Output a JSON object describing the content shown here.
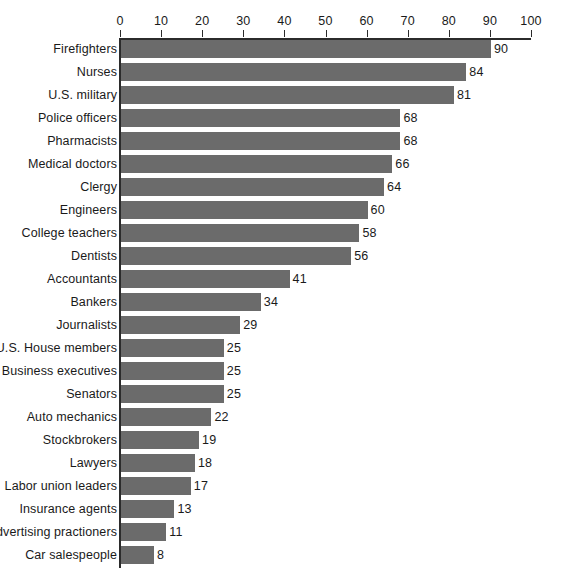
{
  "chart_data": {
    "type": "bar",
    "orientation": "horizontal",
    "title": "",
    "subtitle": "",
    "xlabel": "",
    "ylabel": "",
    "xlim": [
      0,
      100
    ],
    "grid": false,
    "legend": null,
    "tick_labels": [
      "0",
      "10",
      "20",
      "30",
      "40",
      "50",
      "60",
      "70",
      "80",
      "90",
      "100"
    ],
    "ticks": [
      0,
      10,
      20,
      30,
      40,
      50,
      60,
      70,
      80,
      90,
      100
    ],
    "categories": [
      "Firefighters",
      "Nurses",
      "U.S. military",
      "Police officers",
      "Pharmacists",
      "Medical doctors",
      "Clergy",
      "Engineers",
      "College teachers",
      "Dentists",
      "Accountants",
      "Bankers",
      "Journalists",
      "U.S. House members",
      "Business executives",
      "Senators",
      "Auto mechanics",
      "Stockbrokers",
      "Lawyers",
      "Labor union leaders",
      "Insurance agents",
      "Advertising practioners",
      "Car salespeople"
    ],
    "values": [
      90,
      84,
      81,
      68,
      68,
      66,
      64,
      60,
      58,
      56,
      41,
      34,
      29,
      25,
      25,
      25,
      22,
      19,
      18,
      17,
      13,
      11,
      8
    ],
    "value_labels": [
      "90",
      "84",
      "81",
      "68",
      "68",
      "66",
      "64",
      "60",
      "58",
      "56",
      "41",
      "34",
      "29",
      "25",
      "25",
      "25",
      "22",
      "19",
      "18",
      "17",
      "13",
      "11",
      "8"
    ],
    "colors": {
      "bar": "#6b6b6b",
      "axis": "#2b2b2b",
      "text": "#1a1a1a",
      "background": "#ffffff"
    }
  }
}
